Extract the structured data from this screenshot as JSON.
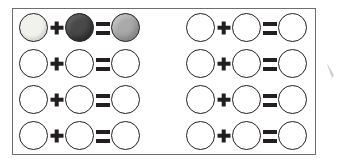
{
  "worksheet": {
    "border_color": "#6d6d72",
    "background_color": "#ffffff",
    "ink_color": "#231f20",
    "shades": {
      "light": "#f2f2ec",
      "dark": "#494949",
      "mid": "#a9a9a9",
      "empty": "#ffffff"
    },
    "operators": {
      "plus": "+",
      "equals": "="
    },
    "groups": [
      {
        "name": "left-group",
        "rows": [
          {
            "addend_1": "light",
            "addend_2": "dark",
            "sum": "mid"
          },
          {
            "addend_1": "empty",
            "addend_2": "empty",
            "sum": "empty"
          },
          {
            "addend_1": "empty",
            "addend_2": "empty",
            "sum": "empty"
          },
          {
            "addend_1": "empty",
            "addend_2": "empty",
            "sum": "empty"
          }
        ]
      },
      {
        "name": "right-group",
        "rows": [
          {
            "addend_1": "empty",
            "addend_2": "empty",
            "sum": "empty"
          },
          {
            "addend_1": "empty",
            "addend_2": "empty",
            "sum": "empty"
          },
          {
            "addend_1": "empty",
            "addend_2": "empty",
            "sum": "empty"
          },
          {
            "addend_1": "empty",
            "addend_2": "empty",
            "sum": "empty"
          }
        ]
      }
    ]
  }
}
